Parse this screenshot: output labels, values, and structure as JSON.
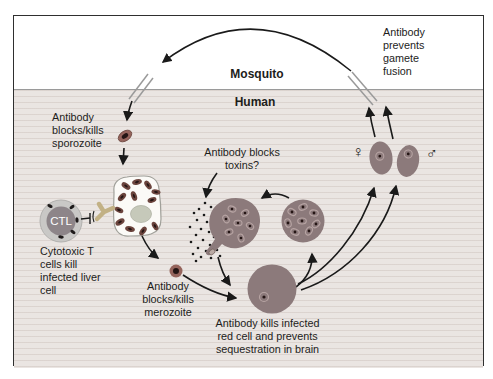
{
  "figure": {
    "regions": {
      "mosquito": "Mosquito",
      "human": "Human"
    },
    "annotations": {
      "gamete_fusion": "Antibody\nprevents\ngamete\nfusion",
      "blocks_sporozoite": "Antibody\nblocks/kills\nsporozoite",
      "blocks_toxins": "Antibody blocks\ntoxins?",
      "ctl_abbrev": "CTL",
      "cytotoxic_t": "Cytotoxic T\ncells kill\ninfected liver\ncell",
      "blocks_merozoite": "Antibody\nblocks/kills\nmerozoite",
      "kills_red_cell": "Antibody kills infected\nred cell and prevents\nsequestration in brain",
      "female_symbol": "♀",
      "male_symbol": "♂"
    },
    "colors": {
      "mosquito_bg": "#ffffff",
      "human_bg": "#eae5e2",
      "frame_border": "#2f2f2f",
      "boundary_line": "#9a9a9a",
      "cell_rose": "#8c7a7b",
      "ring_light": "#b7a4a3",
      "parasite_dark": "#6b443d",
      "parasite_core": "#241514",
      "sporozoite_ring": "#95645c",
      "nucleus_green": "#c6c9ba",
      "liver_fill": "#fbfaf7",
      "liver_outline": "#a0a09a",
      "ctl_outer": "#c9c8c6",
      "ctl_inner": "#8d8589",
      "granule": "#1e1a1a",
      "antibody_tan": "#c2b185",
      "arrow": "#1a1a1a",
      "text": "#1d1d1b"
    }
  }
}
